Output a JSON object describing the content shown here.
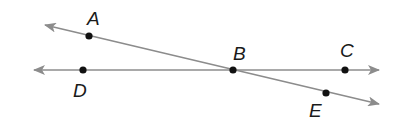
{
  "diagram": {
    "colors": {
      "line": "#8c8c8c",
      "point": "#111111",
      "label": "#1a1a1a"
    },
    "lines": [
      {
        "id": "line-DC",
        "from": [
          34,
          70
        ],
        "to": [
          379,
          70
        ],
        "arrows": "both"
      },
      {
        "id": "line-AE",
        "from": [
          45,
          25
        ],
        "to": [
          379,
          104
        ],
        "arrows": "both"
      }
    ],
    "points": [
      {
        "name": "A",
        "x": 89,
        "y": 36,
        "label_x": 87,
        "label_y": 25
      },
      {
        "name": "D",
        "x": 83,
        "y": 70,
        "label_x": 73,
        "label_y": 97
      },
      {
        "name": "B",
        "x": 233,
        "y": 70,
        "label_x": 233,
        "label_y": 60
      },
      {
        "name": "C",
        "x": 345,
        "y": 70,
        "label_x": 340,
        "label_y": 57
      },
      {
        "name": "E",
        "x": 326,
        "y": 93,
        "label_x": 309,
        "label_y": 117
      }
    ]
  }
}
